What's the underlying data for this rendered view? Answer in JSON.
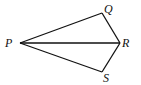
{
  "diagram": {
    "type": "quadrilateral-with-diagonal",
    "vertices": [
      {
        "name": "P",
        "label": "P",
        "x": 20,
        "y": 43,
        "label_x": 5,
        "label_y": 47
      },
      {
        "name": "Q",
        "label": "Q",
        "x": 102,
        "y": 13,
        "label_x": 104,
        "label_y": 13
      },
      {
        "name": "R",
        "label": "R",
        "x": 120,
        "y": 43,
        "label_x": 122,
        "label_y": 47
      },
      {
        "name": "S",
        "label": "S",
        "x": 102,
        "y": 72,
        "label_x": 103,
        "label_y": 82
      }
    ],
    "edges": [
      {
        "from": "P",
        "to": "Q"
      },
      {
        "from": "Q",
        "to": "R"
      },
      {
        "from": "R",
        "to": "S"
      },
      {
        "from": "S",
        "to": "P"
      },
      {
        "from": "P",
        "to": "R"
      }
    ],
    "colors": {
      "stroke": "#111111",
      "background": "#ffffff"
    }
  }
}
